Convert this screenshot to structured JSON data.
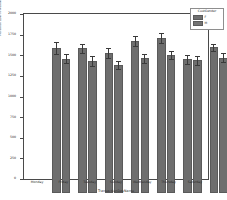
{
  "chart_data": {
    "type": "bar",
    "title": "",
    "xlabel": "TransactionDayName",
    "ylabel": "Personal Loan Investment in Dollars",
    "categories": [
      "Monday",
      "Friday",
      "Tuesday",
      "Sunday",
      "Wednesday",
      "Thursday",
      "Saturday"
    ],
    "series": [
      {
        "name": "F",
        "values": [
          1760,
          1755,
          1700,
          1840,
          1880,
          1620,
          1765
        ],
        "errors": [
          75,
          55,
          60,
          60,
          65,
          55,
          45
        ]
      },
      {
        "name": "M",
        "values": [
          1630,
          1600,
          1555,
          1635,
          1670,
          1610,
          1640
        ],
        "errors": [
          55,
          55,
          50,
          55,
          50,
          55,
          55
        ]
      }
    ],
    "ylim": [
      0,
      2000
    ],
    "yticks": [
      0,
      250,
      500,
      750,
      1000,
      1250,
      1500,
      1750,
      2000
    ],
    "ytick_labels": [
      "0",
      "250",
      "500",
      "750",
      "1000",
      "1250",
      "1500",
      "1750",
      "2000"
    ],
    "grid": false,
    "legend_position": "upper right",
    "bar_color": "#6e6e6e",
    "error_color": "#3a3a3a",
    "background": "#ffffff"
  },
  "legend": {
    "title": "CustGender",
    "entries": [
      {
        "label": "F",
        "color": "#6f6f6f"
      },
      {
        "label": "M",
        "color": "#737373"
      }
    ]
  }
}
